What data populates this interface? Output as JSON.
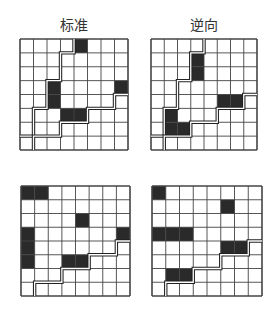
{
  "panels": [
    {
      "id": "standard",
      "title": "标准",
      "position": {
        "x": 20,
        "y": 39,
        "w": 108,
        "h": 111
      },
      "dark_cells": [
        [
          0,
          4
        ],
        [
          3,
          2
        ],
        [
          4,
          2
        ],
        [
          3,
          7
        ],
        [
          5,
          3
        ],
        [
          5,
          4
        ]
      ],
      "paths": [
        [
          [
            4,
            0
          ],
          [
            4,
            1
          ],
          [
            3,
            1
          ],
          [
            3,
            3
          ],
          [
            2,
            3
          ],
          [
            2,
            5
          ],
          [
            1,
            5
          ],
          [
            1,
            7
          ],
          [
            0,
            7
          ]
        ],
        [
          [
            1,
            8
          ],
          [
            1,
            7
          ],
          [
            3,
            7
          ],
          [
            3,
            6
          ],
          [
            5,
            6
          ],
          [
            5,
            5
          ],
          [
            7,
            5
          ],
          [
            7,
            4
          ],
          [
            8,
            4
          ]
        ]
      ]
    },
    {
      "id": "reverse",
      "title": "逆向",
      "position": {
        "x": 151,
        "y": 39,
        "w": 106,
        "h": 111
      },
      "dark_cells": [
        [
          1,
          3
        ],
        [
          2,
          3
        ],
        [
          4,
          5
        ],
        [
          4,
          6
        ],
        [
          5,
          1
        ],
        [
          6,
          1
        ],
        [
          6,
          2
        ]
      ],
      "paths": [
        [
          [
            4,
            0
          ],
          [
            4,
            1
          ],
          [
            3,
            1
          ],
          [
            3,
            3
          ],
          [
            2,
            3
          ],
          [
            2,
            5
          ],
          [
            1,
            5
          ],
          [
            1,
            7
          ],
          [
            0,
            7
          ]
        ],
        [
          [
            1,
            8
          ],
          [
            1,
            7
          ],
          [
            3,
            7
          ],
          [
            3,
            6
          ],
          [
            5,
            6
          ],
          [
            5,
            5
          ],
          [
            7,
            5
          ],
          [
            7,
            4
          ],
          [
            8,
            4
          ]
        ]
      ]
    },
    {
      "id": "bottom-left",
      "title": "",
      "position": {
        "x": 21,
        "y": 186,
        "w": 109,
        "h": 110
      },
      "dark_cells": [
        [
          0,
          0
        ],
        [
          0,
          1
        ],
        [
          2,
          4
        ],
        [
          3,
          0
        ],
        [
          4,
          0
        ],
        [
          5,
          0
        ],
        [
          3,
          7
        ],
        [
          5,
          3
        ],
        [
          5,
          4
        ]
      ],
      "paths": [
        [
          [
            1,
            8
          ],
          [
            1,
            7
          ],
          [
            3,
            7
          ],
          [
            3,
            6
          ],
          [
            5,
            6
          ],
          [
            5,
            5
          ],
          [
            7,
            5
          ],
          [
            7,
            4
          ],
          [
            8,
            4
          ]
        ]
      ]
    },
    {
      "id": "bottom-right",
      "title": "",
      "position": {
        "x": 152,
        "y": 186,
        "w": 110,
        "h": 110
      },
      "dark_cells": [
        [
          0,
          0
        ],
        [
          1,
          5
        ],
        [
          3,
          0
        ],
        [
          3,
          1
        ],
        [
          3,
          2
        ],
        [
          4,
          5
        ],
        [
          4,
          6
        ],
        [
          6,
          1
        ],
        [
          6,
          2
        ]
      ],
      "paths": [
        [
          [
            1,
            8
          ],
          [
            1,
            7
          ],
          [
            3,
            7
          ],
          [
            3,
            6
          ],
          [
            5,
            6
          ],
          [
            5,
            5
          ],
          [
            7,
            5
          ],
          [
            7,
            4
          ],
          [
            8,
            4
          ]
        ]
      ]
    }
  ],
  "grid_size": 8,
  "colors": {
    "dark_cell": "#2a2a2a",
    "grid_line": "#444444",
    "path_line": "#222222"
  }
}
